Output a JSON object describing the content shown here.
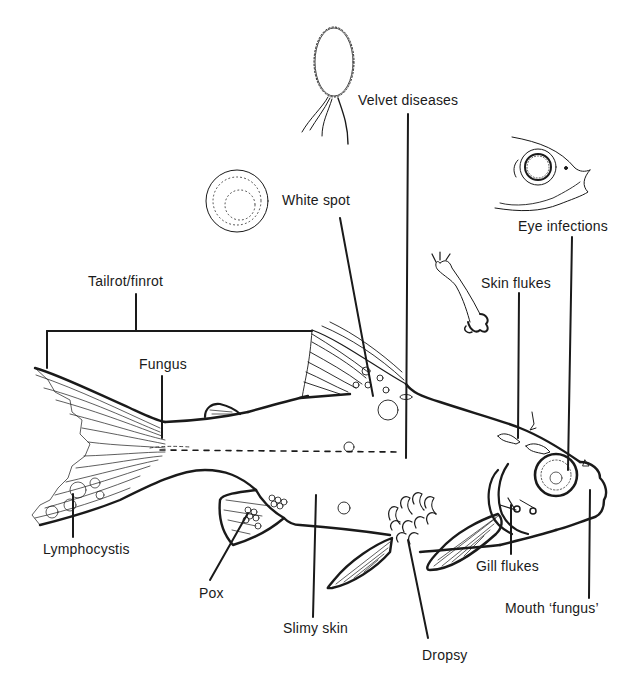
{
  "diagram": {
    "labels": [
      {
        "id": "velvet",
        "text": "Velvet diseases",
        "x": 358,
        "y": 92
      },
      {
        "id": "white-spot",
        "text": "White spot",
        "x": 282,
        "y": 192
      },
      {
        "id": "eye",
        "text": "Eye infections",
        "x": 518,
        "y": 218
      },
      {
        "id": "tailrot",
        "text": "Tailrot/finrot",
        "x": 88,
        "y": 273
      },
      {
        "id": "skin-flukes",
        "text": "Skin flukes",
        "x": 481,
        "y": 275
      },
      {
        "id": "fungus",
        "text": "Fungus",
        "x": 139,
        "y": 356
      },
      {
        "id": "lymphocystis",
        "text": "Lymphocystis",
        "x": 43,
        "y": 541
      },
      {
        "id": "pox",
        "text": "Pox",
        "x": 199,
        "y": 585
      },
      {
        "id": "gill-flukes",
        "text": "Gill flukes",
        "x": 476,
        "y": 558
      },
      {
        "id": "mouth",
        "text": "Mouth ‘fungus’",
        "x": 505,
        "y": 600
      },
      {
        "id": "slimy-skin",
        "text": "Slimy skin",
        "x": 283,
        "y": 620
      },
      {
        "id": "dropsy",
        "text": "Dropsy",
        "x": 422,
        "y": 647
      }
    ],
    "insets": [
      {
        "id": "velvet-parasite",
        "description": "Velvet dinoflagellate parasite"
      },
      {
        "id": "white-spot-cyst",
        "description": "White spot cyst"
      },
      {
        "id": "eye-fish-head",
        "description": "Fish head with infected eye"
      },
      {
        "id": "skin-fluke",
        "description": "Skin fluke parasite"
      }
    ],
    "colors": {
      "ink": "#1a1a1a",
      "background": "#ffffff"
    }
  }
}
